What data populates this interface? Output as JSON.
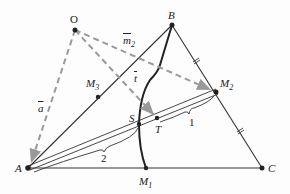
{
  "diagram": {
    "colors": {
      "line": "#333333",
      "dashed": "#9a9a9a",
      "point": "#222222",
      "curve": "#222222"
    },
    "points": {
      "O": {
        "label": "O",
        "x": 75,
        "y": 30
      },
      "B": {
        "label": "B",
        "x": 172,
        "y": 25
      },
      "A": {
        "label": "A",
        "x": 28,
        "y": 168
      },
      "C": {
        "label": "C",
        "x": 262,
        "y": 168
      },
      "M1": {
        "label": "M",
        "sub": "1",
        "x": 146,
        "y": 168
      },
      "M2": {
        "label": "M",
        "sub": "2",
        "x": 216,
        "y": 92
      },
      "M3": {
        "label": "M",
        "sub": "3",
        "x": 98,
        "y": 97
      },
      "S": {
        "label": "S",
        "x": 139,
        "y": 124
      },
      "T": {
        "label": "T",
        "x": 157,
        "y": 118
      }
    },
    "vectors": {
      "a": {
        "label": "a"
      },
      "m2": {
        "label": "m",
        "sub": "2"
      },
      "t": {
        "label": "t"
      }
    },
    "ratio_labels": {
      "AT": "2",
      "TM2": "1"
    }
  }
}
